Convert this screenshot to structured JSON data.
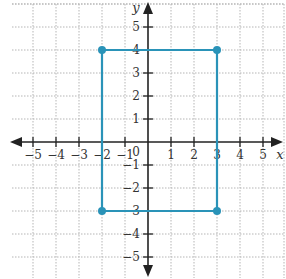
{
  "chart_data": {
    "type": "scatter",
    "title": "",
    "xlabel": "x",
    "ylabel": "y",
    "xlim": [
      -6,
      5.5
    ],
    "ylim": [
      -5.8,
      5.8
    ],
    "grid": true,
    "x_ticks": [
      -5,
      -4,
      -3,
      -2,
      -1,
      1,
      2,
      3,
      4,
      5
    ],
    "y_ticks": [
      -5,
      -4,
      -3,
      -2,
      -1,
      1,
      2,
      3,
      4,
      5
    ],
    "origin_label": "0",
    "series": [
      {
        "name": "rectangle",
        "shape": "polygon",
        "closed": true,
        "points": [
          {
            "x": -2,
            "y": 4
          },
          {
            "x": 3,
            "y": 4
          },
          {
            "x": 3,
            "y": -3
          },
          {
            "x": -2,
            "y": -3
          }
        ],
        "color": "#2a93b8"
      }
    ]
  },
  "style": {
    "shape_color": "#2a93b8",
    "axis_color": "#222222",
    "grid_color": "#b5b5b5"
  }
}
